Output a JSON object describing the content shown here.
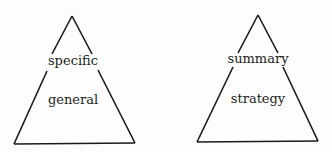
{
  "diagrams": [
    {
      "name": "left-pyramid",
      "top_label": "specific",
      "middle_label": "general"
    },
    {
      "name": "right-pyramid",
      "top_label": "summary",
      "middle_label": "strategy"
    }
  ],
  "colors": {
    "stroke": "#1a1a1a",
    "text": "#1e1e1e",
    "background": "#fdfdfd"
  }
}
